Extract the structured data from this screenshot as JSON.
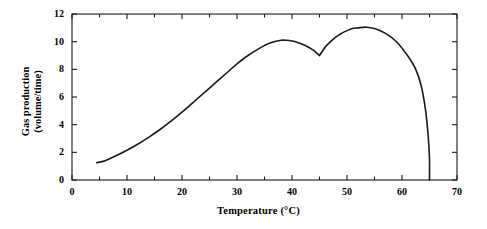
{
  "chart_data": {
    "type": "line",
    "title": "",
    "xlabel": "Temperature (°C)",
    "ylabel_line1": "Gas production",
    "ylabel_line2": "(volume/time)",
    "xlim": [
      0,
      70
    ],
    "ylim": [
      0,
      12
    ],
    "xticks_major": [
      0,
      10,
      20,
      30,
      40,
      50,
      60,
      70
    ],
    "xticks_minor": [
      5,
      15,
      25,
      35,
      45,
      55,
      65
    ],
    "yticks_major": [
      0,
      2,
      4,
      6,
      8,
      10,
      12
    ],
    "xtick_labels": [
      "0",
      "10",
      "20",
      "30",
      "40",
      "50",
      "60",
      "70"
    ],
    "ytick_labels": [
      "0",
      "2",
      "4",
      "6",
      "8",
      "10",
      "12"
    ],
    "grid": false,
    "legend": "none",
    "series": [
      {
        "name": "Gas production",
        "color": "#1a1a1a",
        "x": [
          4.5,
          6,
          8,
          10,
          12,
          14,
          16,
          18,
          20,
          22,
          24,
          26,
          28,
          30,
          32,
          34,
          36,
          38,
          39,
          40,
          41,
          42,
          43,
          44,
          45,
          46,
          47,
          48,
          49,
          50,
          51,
          52,
          53.5,
          55,
          57,
          59,
          61,
          62.5,
          63.5,
          64.3,
          64.8,
          65,
          65,
          65
        ],
        "y": [
          1.25,
          1.4,
          1.75,
          2.15,
          2.6,
          3.1,
          3.65,
          4.25,
          4.9,
          5.6,
          6.3,
          7.0,
          7.7,
          8.4,
          9.0,
          9.5,
          9.9,
          10.1,
          10.1,
          10.05,
          9.95,
          9.8,
          9.6,
          9.35,
          9.0,
          9.6,
          10.0,
          10.35,
          10.6,
          10.8,
          10.95,
          11.0,
          11.05,
          10.95,
          10.6,
          10.0,
          9.0,
          8.0,
          6.8,
          5.0,
          3.0,
          1.5,
          0.6,
          0.0
        ]
      }
    ],
    "annotations": {
      "optimum_temperature_c": 53.5,
      "peak_value": 11.05,
      "notch_temperature_c": 45,
      "notch_value": 9.0,
      "cutoff_temperature_c": 65
    }
  },
  "axes": {
    "x_pixel_origin": 72,
    "x_pixel_per_unit": 5.5,
    "y_pixel_origin": 180,
    "y_pixel_per_unit": 13.83
  }
}
